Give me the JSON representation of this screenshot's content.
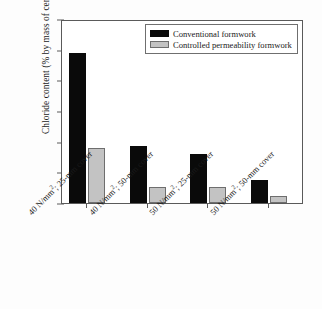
{
  "chart_data": {
    "type": "bar",
    "title": "",
    "xlabel": "",
    "ylabel": "Chloride content (% by mass of cement)",
    "ylim": [
      0,
      6
    ],
    "yticks": [
      0,
      1,
      2,
      3,
      4,
      5,
      6
    ],
    "ytick_labels": [
      "0",
      "1",
      "2",
      "3",
      "4",
      "5",
      "6"
    ],
    "grid": false,
    "legend_position": "top-right",
    "categories": [
      "40 N/mm²; 25-mm cover",
      "40 N/mm²; 50-mm cover",
      "50 N/mm²; 25-mm cover",
      "50 N/mm²; 50-mm cover"
    ],
    "category_parts": [
      {
        "pre": "40 N/mm",
        "sup": "2",
        "post": "; 25-mm cover"
      },
      {
        "pre": "40 N/mm",
        "sup": "2",
        "post": "; 50-mm cover"
      },
      {
        "pre": "50 N/mm",
        "sup": "2",
        "post": "; 25-mm cover"
      },
      {
        "pre": "50 N/mm",
        "sup": "2",
        "post": "; 50-mm cover"
      }
    ],
    "series": [
      {
        "name": "Conventional formwork",
        "color": "#0a0a0a",
        "values": [
          4.88,
          1.85,
          1.6,
          0.74
        ]
      },
      {
        "name": "Controlled permeability formwork",
        "color": "#c3c3c3",
        "values": [
          1.81,
          0.53,
          0.52,
          0.22
        ]
      }
    ]
  },
  "legend": {
    "items": [
      {
        "label": "Conventional formwork"
      },
      {
        "label": "Controlled permeability formwork"
      }
    ]
  }
}
